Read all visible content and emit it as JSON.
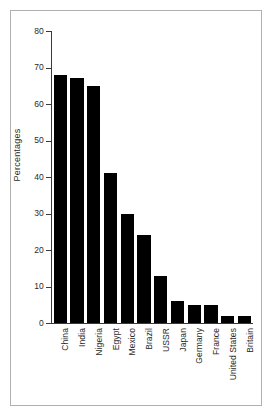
{
  "chart_data": {
    "type": "bar",
    "title": "",
    "xlabel": "",
    "ylabel": "Percentages",
    "ylim": [
      0,
      80
    ],
    "yticks": [
      0,
      10,
      20,
      30,
      40,
      50,
      60,
      70,
      80
    ],
    "ytick_labels": [
      "0",
      "10",
      "20",
      "30",
      "40",
      "50",
      "60",
      "70",
      "80"
    ],
    "grid": false,
    "legend": "none",
    "bar_color": "#000000",
    "background_color": "#ffffff",
    "frame_color": "#b0b0b0",
    "categories": [
      "China",
      "India",
      "Nigeria",
      "Egypt",
      "Mexico",
      "Brazil",
      "USSR",
      "Japan",
      "Germany",
      "France",
      "United States",
      "Britain"
    ],
    "values": [
      68,
      67,
      65,
      41,
      30,
      24,
      13,
      6,
      5,
      5,
      2,
      2
    ]
  }
}
